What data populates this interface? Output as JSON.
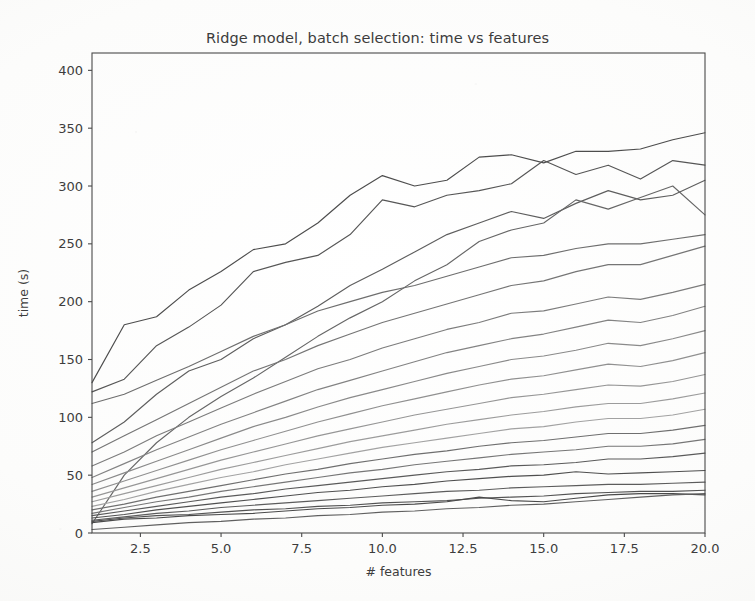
{
  "chart_data": {
    "type": "line",
    "title": "Ridge model, batch selection: time vs features",
    "xlabel": "# features",
    "ylabel": "time (s)",
    "xlim": [
      1,
      20
    ],
    "ylim": [
      0,
      415
    ],
    "xticks": [
      "2.5",
      "5.0",
      "7.5",
      "10.0",
      "12.5",
      "15.0",
      "17.5",
      "20.0"
    ],
    "xtick_values": [
      2.5,
      5.0,
      7.5,
      10.0,
      12.5,
      15.0,
      17.5,
      20.0
    ],
    "yticks": [
      "0",
      "50",
      "100",
      "150",
      "200",
      "250",
      "300",
      "350",
      "400"
    ],
    "ytick_values": [
      0,
      50,
      100,
      150,
      200,
      250,
      300,
      350,
      400
    ],
    "grid": false,
    "legend": "none",
    "x": [
      1,
      2,
      3,
      4,
      5,
      6,
      7,
      8,
      9,
      10,
      11,
      12,
      13,
      14,
      15,
      16,
      17,
      18,
      19,
      20
    ],
    "series": [
      {
        "name": "batch-1",
        "color": "#4d4d4d",
        "values": [
          130,
          180,
          187,
          210,
          226,
          245,
          250,
          268,
          292,
          309,
          300,
          305,
          325,
          327,
          320,
          330,
          330,
          332,
          340,
          346
        ]
      },
      {
        "name": "batch-2",
        "color": "#565656",
        "values": [
          122,
          133,
          162,
          178,
          197,
          226,
          234,
          240,
          258,
          288,
          282,
          292,
          296,
          302,
          322,
          310,
          318,
          306,
          322,
          318
        ]
      },
      {
        "name": "batch-3",
        "color": "#5e5e5e",
        "values": [
          78,
          96,
          120,
          140,
          150,
          168,
          180,
          196,
          214,
          228,
          243,
          258,
          268,
          278,
          272,
          285,
          296,
          288,
          292,
          305
        ]
      },
      {
        "name": "batch-4",
        "color": "#666666",
        "values": [
          8,
          50,
          78,
          100,
          118,
          134,
          152,
          170,
          186,
          200,
          218,
          232,
          252,
          262,
          268,
          288,
          280,
          290,
          300,
          275
        ]
      },
      {
        "name": "batch-5",
        "color": "#6e6e6e",
        "values": [
          112,
          120,
          132,
          144,
          157,
          170,
          180,
          192,
          200,
          208,
          214,
          222,
          230,
          238,
          240,
          246,
          250,
          250,
          254,
          258
        ]
      },
      {
        "name": "batch-6",
        "color": "#757575",
        "values": [
          70,
          84,
          98,
          112,
          126,
          140,
          150,
          162,
          172,
          182,
          190,
          198,
          206,
          214,
          218,
          226,
          232,
          232,
          240,
          248
        ]
      },
      {
        "name": "batch-7",
        "color": "#7c7c7c",
        "values": [
          58,
          70,
          84,
          96,
          108,
          120,
          131,
          142,
          150,
          160,
          168,
          176,
          182,
          190,
          192,
          198,
          204,
          202,
          208,
          215
        ]
      },
      {
        "name": "batch-8",
        "color": "#838383",
        "values": [
          48,
          60,
          72,
          83,
          94,
          104,
          114,
          124,
          132,
          140,
          148,
          156,
          162,
          168,
          172,
          178,
          184,
          182,
          188,
          196
        ]
      },
      {
        "name": "batch-9",
        "color": "#8a8a8a",
        "values": [
          42,
          52,
          62,
          72,
          82,
          92,
          100,
          109,
          117,
          124,
          131,
          138,
          144,
          150,
          153,
          158,
          164,
          162,
          168,
          175
        ]
      },
      {
        "name": "batch-10",
        "color": "#909090",
        "values": [
          36,
          45,
          54,
          63,
          72,
          80,
          88,
          96,
          103,
          110,
          116,
          122,
          128,
          133,
          136,
          141,
          146,
          144,
          149,
          156
        ]
      },
      {
        "name": "batch-11",
        "color": "#969696",
        "values": [
          31,
          39,
          47,
          55,
          63,
          70,
          77,
          84,
          90,
          96,
          102,
          107,
          112,
          117,
          120,
          124,
          128,
          127,
          131,
          137
        ]
      },
      {
        "name": "batch-12",
        "color": "#9c9c9c",
        "values": [
          27,
          34,
          41,
          48,
          55,
          61,
          67,
          73,
          79,
          84,
          89,
          94,
          98,
          102,
          105,
          109,
          112,
          112,
          116,
          121
        ]
      },
      {
        "name": "batch-13",
        "color": "#a2a2a2",
        "values": [
          23,
          29,
          36,
          42,
          48,
          53,
          59,
          64,
          69,
          74,
          78,
          82,
          86,
          90,
          92,
          96,
          99,
          99,
          102,
          107
        ]
      },
      {
        "name": "batch-14",
        "color": "#6f6f6f",
        "values": [
          20,
          25,
          31,
          36,
          41,
          46,
          51,
          55,
          60,
          64,
          68,
          71,
          75,
          78,
          80,
          83,
          86,
          86,
          89,
          93
        ]
      },
      {
        "name": "batch-15",
        "color": "#767676",
        "values": [
          17,
          22,
          27,
          31,
          36,
          40,
          44,
          48,
          52,
          55,
          59,
          62,
          65,
          68,
          70,
          72,
          75,
          75,
          77,
          81
        ]
      },
      {
        "name": "batch-16",
        "color": "#5a5a5a",
        "values": [
          15,
          19,
          23,
          27,
          31,
          34,
          38,
          41,
          44,
          47,
          50,
          53,
          55,
          58,
          59,
          61,
          64,
          64,
          66,
          69
        ]
      },
      {
        "name": "batch-17",
        "color": "#4f4f4f",
        "values": [
          13,
          16,
          20,
          23,
          26,
          29,
          32,
          35,
          37,
          40,
          42,
          45,
          47,
          49,
          50,
          53,
          51,
          52,
          53,
          54
        ]
      },
      {
        "name": "batch-18",
        "color": "#5c5c5c",
        "values": [
          11,
          14,
          17,
          19,
          22,
          24,
          26,
          28,
          30,
          32,
          34,
          36,
          37,
          39,
          40,
          41,
          42,
          42,
          43,
          44
        ]
      },
      {
        "name": "batch-19",
        "color": "#535353",
        "values": [
          10,
          13,
          15,
          16,
          18,
          20,
          21,
          23,
          24,
          26,
          27,
          28,
          30,
          31,
          32,
          34,
          35,
          36,
          36,
          37
        ]
      },
      {
        "name": "batch-20",
        "color": "#4a4a4a",
        "values": [
          9,
          12,
          13,
          15,
          16,
          17,
          19,
          21,
          22,
          24,
          25,
          27,
          31,
          28,
          27,
          30,
          33,
          34,
          34,
          33
        ]
      },
      {
        "name": "batch-21",
        "color": "#606060",
        "values": [
          3,
          5,
          7,
          9,
          10,
          12,
          13,
          15,
          16,
          18,
          19,
          21,
          22,
          24,
          25,
          27,
          29,
          31,
          33,
          34
        ]
      }
    ]
  }
}
